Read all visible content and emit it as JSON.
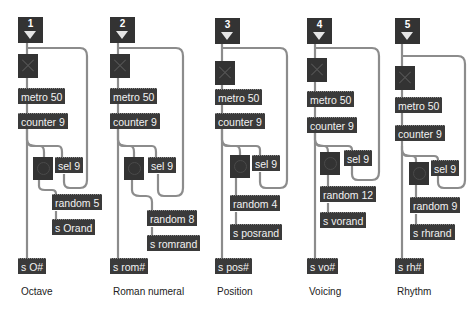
{
  "patch": {
    "colors": {
      "object_bg": "#3a3a3a",
      "object_text": "#f2f2f2",
      "wire": "#8c8c8c",
      "background": "#ffffff"
    },
    "columns": [
      {
        "inlet": "1",
        "metro": "metro 50",
        "counter": "counter 9",
        "sel": "sel 9",
        "random": "random 5",
        "send_rand": "s Orand",
        "send_main": "s O#",
        "label": "Octave"
      },
      {
        "inlet": "2",
        "metro": "metro 50",
        "counter": "counter 9",
        "sel": "sel 9",
        "random": "random 8",
        "send_rand": "s romrand",
        "send_main": "s rom#",
        "label": "Roman numeral"
      },
      {
        "inlet": "3",
        "metro": "metro 50",
        "counter": "counter 9",
        "sel": "sel 9",
        "random": "random 4",
        "send_rand": "s posrand",
        "send_main": "s pos#",
        "label": "Position"
      },
      {
        "inlet": "4",
        "metro": "metro 50",
        "counter": "counter 9",
        "sel": "sel 9",
        "random": "random 12",
        "send_rand": "s vorand",
        "send_main": "s vo#",
        "label": "Voicing"
      },
      {
        "inlet": "5",
        "metro": "metro 50",
        "counter": "counter 9",
        "sel": "sel 9",
        "random": "random 9",
        "send_rand": "s rhrand",
        "send_main": "s rh#",
        "label": "Rhythm"
      }
    ]
  }
}
